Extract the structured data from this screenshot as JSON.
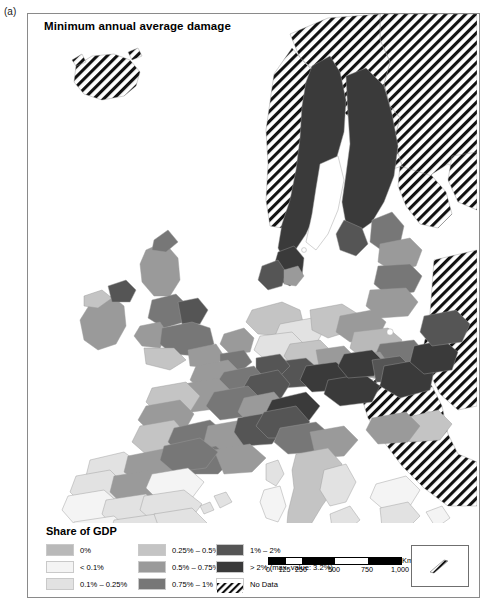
{
  "panel": {
    "label": "(a)"
  },
  "map": {
    "title": "Minimum annual average damage",
    "region": "Europe (NUTS regions)"
  },
  "legend": {
    "title": "Share of GDP",
    "columns": [
      [
        {
          "label": "0%",
          "color": "#b9b9b9",
          "pattern": "solid"
        },
        {
          "label": "< 0.1%",
          "color": "#f4f4f4",
          "pattern": "solid"
        },
        {
          "label": "0.1% – 0.25%",
          "color": "#e2e2e2",
          "pattern": "solid"
        }
      ],
      [
        {
          "label": "0.25% – 0.5%",
          "color": "#c4c4c4",
          "pattern": "solid"
        },
        {
          "label": "0.5% – 0.75%",
          "color": "#9a9a9a",
          "pattern": "solid"
        },
        {
          "label": "0.75% – 1%",
          "color": "#777777",
          "pattern": "solid"
        }
      ],
      [
        {
          "label": "1% – 2%",
          "color": "#555555",
          "pattern": "solid"
        },
        {
          "label": "> 2% (max. value: 3.2%)",
          "color": "#3a3a3a",
          "pattern": "solid"
        },
        {
          "label": "No Data",
          "color": "#ffffff",
          "pattern": "hatch"
        }
      ]
    ]
  },
  "scalebar": {
    "unit": "Km",
    "ticks": [
      "0",
      "125",
      "250",
      "500",
      "750",
      "1,000"
    ],
    "max": 1000
  },
  "inset": {
    "pattern": "hatch"
  },
  "colors": {
    "class_0": "#b9b9b9",
    "class_lt01": "#f4f4f4",
    "class_01_025": "#e2e2e2",
    "class_025_05": "#c4c4c4",
    "class_05_075": "#9a9a9a",
    "class_075_1": "#777777",
    "class_1_2": "#555555",
    "class_gt2": "#3a3a3a",
    "no_data": "#ffffff",
    "frame": "#8a8a8a",
    "sea": "#ffffff"
  }
}
